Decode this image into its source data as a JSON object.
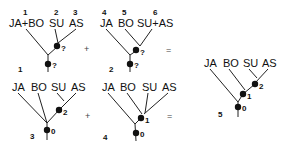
{
  "diagram": {
    "type": "phylogenetic-tree-combination",
    "trees": [
      {
        "id": "1",
        "leaves": [
          "JA+BO",
          "SU",
          "AS"
        ],
        "leaf_numbers": [
          "1",
          "2",
          "3"
        ],
        "node_labels": [
          "?",
          "?"
        ]
      },
      {
        "id": "2",
        "leaves": [
          "JA",
          "BO",
          "SU+AS"
        ],
        "leaf_numbers": [
          "4",
          "5",
          "6"
        ],
        "node_labels": [
          "?",
          "?"
        ]
      },
      {
        "id": "3",
        "leaves": [
          "JA",
          "BO",
          "SU",
          "AS"
        ],
        "node_labels": [
          "2",
          "0"
        ]
      },
      {
        "id": "4",
        "leaves": [
          "JA",
          "BO",
          "SU",
          "AS"
        ],
        "node_labels": [
          "1",
          "0"
        ]
      },
      {
        "id": "5",
        "leaves": [
          "JA",
          "BO",
          "SU",
          "AS"
        ],
        "node_labels": [
          "2",
          "1",
          "0"
        ]
      }
    ],
    "operators": {
      "plus": "+",
      "equals": "="
    }
  }
}
